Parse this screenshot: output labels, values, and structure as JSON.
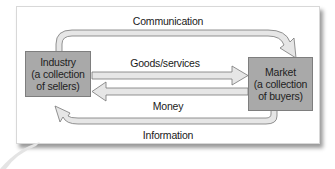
{
  "diagram": {
    "nodes": {
      "industry": {
        "lines": [
          "Industry",
          "(a collection",
          "of sellers)"
        ]
      },
      "market": {
        "lines": [
          "Market",
          "(a collection",
          "of buyers)"
        ]
      }
    },
    "flows": {
      "communication": {
        "label": "Communication",
        "from": "industry",
        "to": "market"
      },
      "goods_services": {
        "label": "Goods/services",
        "from": "industry",
        "to": "market"
      },
      "money": {
        "label": "Money",
        "from": "market",
        "to": "industry"
      },
      "information": {
        "label": "Information",
        "from": "market",
        "to": "industry"
      }
    },
    "colors": {
      "node_fill": "#a9a9a9",
      "arrow_fill": "#e6e6e6",
      "arrow_stroke": "#777777",
      "panel_shadow": "#9a9a9a"
    }
  }
}
